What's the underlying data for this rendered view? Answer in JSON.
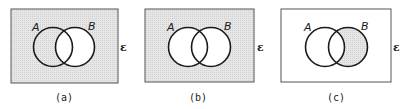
{
  "figure": {
    "universal_set_symbol": "ε",
    "colors": {
      "shade": "#e2e2e2",
      "stroke": "#1a1a1a",
      "frame": "#555555",
      "background": "#ffffff"
    },
    "panels": [
      {
        "caption": "(a)",
        "set_labels": [
          "A",
          "B"
        ],
        "shaded_region": "complement of B (B')"
      },
      {
        "caption": "(b)",
        "set_labels": [
          "A",
          "B"
        ],
        "shaded_region": "complement of A ∪ B"
      },
      {
        "caption": "(c)",
        "set_labels": [
          "A",
          "B"
        ],
        "shaded_region": "B minus A"
      }
    ]
  }
}
